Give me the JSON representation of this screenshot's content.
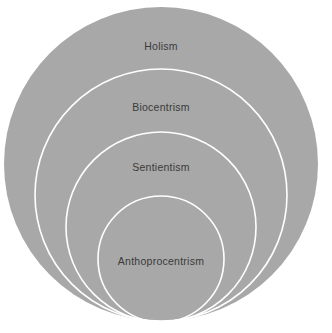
{
  "diagram": {
    "type": "nested-circles-euler",
    "title": "",
    "canvas": {
      "width": 332,
      "height": 333,
      "background": "#ffffff"
    },
    "style": {
      "fill_color": "#a8a8a8",
      "ring_color": "#ffffff",
      "ring_width": 1.6,
      "label_color": "#3a3a3a",
      "label_font_size": 10.5
    },
    "circles": [
      {
        "label": "Holism",
        "level": 1,
        "role": "outermost",
        "cx": 161,
        "cy": 164,
        "r": 157,
        "filled": true,
        "outlined": false,
        "label_x": 161,
        "label_y": 46
      },
      {
        "label": "Biocentrism",
        "level": 2,
        "role": "inner",
        "cx": 161,
        "cy": 195,
        "r": 126,
        "filled": false,
        "outlined": true,
        "label_x": 161,
        "label_y": 107
      },
      {
        "label": "Sentientism",
        "level": 3,
        "role": "inner",
        "cx": 161,
        "cy": 227,
        "r": 95,
        "filled": false,
        "outlined": true,
        "label_x": 161,
        "label_y": 167
      },
      {
        "label": "Anthoprocentrism",
        "level": 4,
        "role": "innermost",
        "cx": 161,
        "cy": 259,
        "r": 63,
        "filled": false,
        "outlined": true,
        "label_x": 161,
        "label_y": 261
      }
    ]
  }
}
